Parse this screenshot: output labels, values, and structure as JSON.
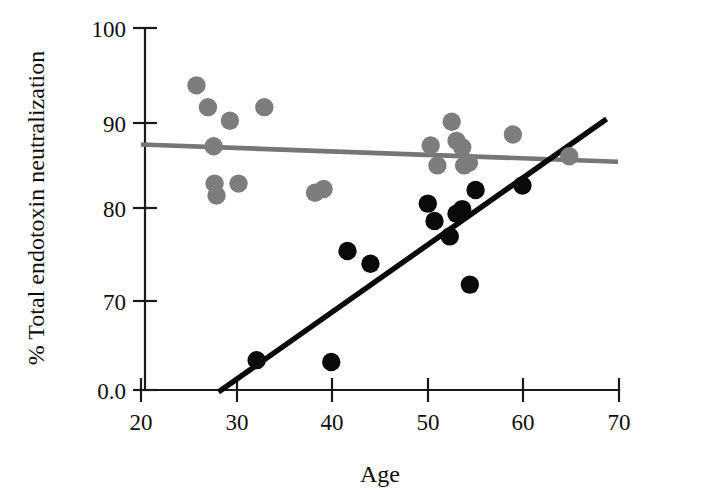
{
  "chart_data": {
    "type": "scatter",
    "title": "",
    "xlabel": "Age",
    "ylabel": "% Total endotoxin neutralization",
    "xlim": [
      20,
      70
    ],
    "ylim": [
      0,
      100
    ],
    "xticks": [
      20,
      30,
      40,
      50,
      60,
      70
    ],
    "xtick_labels": [
      "20",
      "30",
      "40",
      "50",
      "60",
      "70"
    ],
    "yticks": [
      100,
      90,
      80,
      70,
      0
    ],
    "ytick_labels": [
      "100",
      "90",
      "80",
      "70",
      "0.0"
    ],
    "grid": false,
    "legend": "none",
    "y_axis_note": "Axis is broken: ticks at 100, 90, 80, 70 are evenly spaced, then a longer gap down to 0.0 at the origin",
    "series": [
      {
        "name": "gray-group",
        "marker": "filled-circle",
        "color": "#7d7d7d",
        "points": [
          {
            "x": 25.8,
            "y": 93.7
          },
          {
            "x": 27.0,
            "y": 91.3
          },
          {
            "x": 27.6,
            "y": 87.0
          },
          {
            "x": 27.7,
            "y": 82.9
          },
          {
            "x": 27.9,
            "y": 81.6
          },
          {
            "x": 29.3,
            "y": 89.8
          },
          {
            "x": 30.2,
            "y": 82.9
          },
          {
            "x": 32.9,
            "y": 91.3
          },
          {
            "x": 38.2,
            "y": 81.9
          },
          {
            "x": 39.1,
            "y": 82.3
          },
          {
            "x": 50.3,
            "y": 87.1
          },
          {
            "x": 51.0,
            "y": 84.9
          },
          {
            "x": 52.5,
            "y": 89.7
          },
          {
            "x": 53.0,
            "y": 87.6
          },
          {
            "x": 53.6,
            "y": 86.9
          },
          {
            "x": 53.8,
            "y": 84.9
          },
          {
            "x": 54.3,
            "y": 85.2
          },
          {
            "x": 58.9,
            "y": 88.3
          },
          {
            "x": 64.8,
            "y": 85.9
          }
        ]
      },
      {
        "name": "black-group",
        "marker": "filled-circle",
        "color": "#0a0a0a",
        "points": [
          {
            "x": 32.1,
            "y": 63.5
          },
          {
            "x": 39.9,
            "y": 63.3
          },
          {
            "x": 41.6,
            "y": 75.5
          },
          {
            "x": 44.0,
            "y": 74.1
          },
          {
            "x": 50.0,
            "y": 80.7
          },
          {
            "x": 50.7,
            "y": 78.8
          },
          {
            "x": 52.3,
            "y": 77.1
          },
          {
            "x": 53.0,
            "y": 79.6
          },
          {
            "x": 53.6,
            "y": 80.1
          },
          {
            "x": 54.4,
            "y": 71.8
          },
          {
            "x": 55.0,
            "y": 82.2
          },
          {
            "x": 59.9,
            "y": 82.7
          }
        ]
      }
    ],
    "trendlines": [
      {
        "name": "gray-trendline",
        "color": "#767676",
        "x_start": 20.0,
        "y_start": 87.2,
        "x_end": 69.9,
        "y_end": 85.3,
        "description": "Nearly flat, very slight negative slope"
      },
      {
        "name": "black-trendline",
        "color": "#0a0a0a",
        "x_start": 28.1,
        "y_start": 60.0,
        "x_end": 68.7,
        "y_end": 90.0,
        "description": "Steep positive slope"
      }
    ]
  },
  "axis": {
    "x_title": "Age",
    "y_title": "% Total endotoxin neutralization"
  }
}
